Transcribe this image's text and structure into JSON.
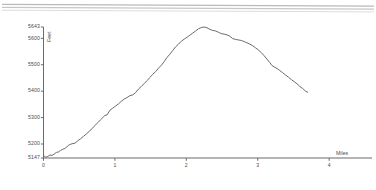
{
  "decor": {
    "top_rule_count": 2,
    "color": "#b9b9b9"
  },
  "chart_data": {
    "type": "line",
    "title": "",
    "subtitle": "",
    "xlabel": "Miles",
    "ylabel": "Feet",
    "grid": false,
    "legend": false,
    "line_color": "#6b6b6b",
    "axis_color": "#6b6b6b",
    "background": "#ffffff",
    "xlim": [
      0,
      4.6
    ],
    "ylim": [
      5147,
      5643
    ],
    "xticks": [
      0,
      1,
      2,
      3,
      4
    ],
    "xtick_labels": [
      "0",
      "1",
      "2",
      "3",
      "4"
    ],
    "yticks": [
      5147,
      5200,
      5300,
      5400,
      5500,
      5600,
      5643
    ],
    "ytick_labels": [
      "5147",
      "5200",
      "5300",
      "5400",
      "5500",
      "5600",
      "5643"
    ],
    "series": [
      {
        "name": "Elevation profile",
        "x": [
          0.0,
          0.03,
          0.06,
          0.09,
          0.12,
          0.15,
          0.18,
          0.21,
          0.24,
          0.27,
          0.3,
          0.33,
          0.36,
          0.4,
          0.44,
          0.48,
          0.52,
          0.56,
          0.6,
          0.64,
          0.68,
          0.72,
          0.76,
          0.8,
          0.83,
          0.86,
          0.89,
          0.93,
          0.97,
          1.01,
          1.05,
          1.09,
          1.13,
          1.17,
          1.21,
          1.25,
          1.29,
          1.33,
          1.37,
          1.41,
          1.45,
          1.49,
          1.53,
          1.57,
          1.61,
          1.65,
          1.69,
          1.73,
          1.77,
          1.81,
          1.85,
          1.89,
          1.93,
          1.97,
          2.01,
          2.05,
          2.09,
          2.13,
          2.17,
          2.21,
          2.25,
          2.29,
          2.33,
          2.37,
          2.41,
          2.45,
          2.49,
          2.53,
          2.57,
          2.61,
          2.65,
          2.69,
          2.73,
          2.77,
          2.81,
          2.85,
          2.89,
          2.93,
          2.97,
          3.01,
          3.05,
          3.09,
          3.13,
          3.17,
          3.2,
          3.23,
          3.27,
          3.31,
          3.35,
          3.39,
          3.43,
          3.47,
          3.51,
          3.55,
          3.59,
          3.63,
          3.67,
          3.7
        ],
        "y": [
          5157,
          5150,
          5153,
          5158,
          5157,
          5162,
          5168,
          5170,
          5176,
          5180,
          5183,
          5190,
          5197,
          5201,
          5203,
          5212,
          5220,
          5229,
          5238,
          5248,
          5258,
          5270,
          5281,
          5292,
          5300,
          5308,
          5310,
          5328,
          5336,
          5344,
          5352,
          5362,
          5370,
          5376,
          5383,
          5386,
          5395,
          5408,
          5418,
          5429,
          5440,
          5452,
          5464,
          5474,
          5487,
          5498,
          5512,
          5528,
          5540,
          5554,
          5568,
          5578,
          5589,
          5597,
          5604,
          5612,
          5620,
          5628,
          5636,
          5641,
          5643,
          5640,
          5634,
          5630,
          5628,
          5623,
          5618,
          5616,
          5613,
          5608,
          5599,
          5596,
          5594,
          5592,
          5588,
          5583,
          5578,
          5572,
          5564,
          5556,
          5546,
          5534,
          5521,
          5508,
          5497,
          5492,
          5486,
          5478,
          5470,
          5461,
          5453,
          5444,
          5436,
          5428,
          5418,
          5410,
          5400,
          5396
        ]
      }
    ],
    "peak": {
      "elevation": 5643,
      "mile": 1.85
    },
    "start": {
      "elevation": 5147,
      "mile": 0
    },
    "end": {
      "elevation": 5160,
      "mile": 3.7
    }
  }
}
